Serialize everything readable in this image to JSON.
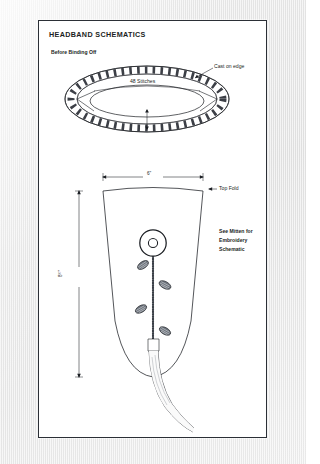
{
  "page": {
    "title": "HEADBAND SCHEMATICS",
    "sheet_bg": "#ffffff",
    "border_color": "#2b2f36",
    "backdrop_color": "#eaeaea",
    "ink_color": "#1b1e23"
  },
  "ring_diagram": {
    "caption": "Before Binding Off",
    "cast_on_label": "Cast on edge",
    "stitch_count_label": "48 Stitches",
    "width_dimension": "3 ¼\"",
    "width_dimension_value": "3",
    "width_dimension_fraction": "¼",
    "width_dimension_unit": "\"",
    "stitch_tick_count": 48
  },
  "panel_diagram": {
    "top_width_dimension": "6\"",
    "top_fold_label": "Top Fold",
    "height_dimension": "8 ¼\"",
    "height_dimension_value": "8",
    "height_dimension_fraction": "¼",
    "height_dimension_unit": "\"",
    "embroidery_note_line1": "See Mitten for",
    "embroidery_note_line2": "Embroidery",
    "embroidery_note_line3": "Schematic",
    "motif": {
      "name": "flower-motif",
      "leaf_count": 4,
      "bloom_rings": 2
    },
    "tassel": {
      "name": "hanging-cord"
    }
  }
}
